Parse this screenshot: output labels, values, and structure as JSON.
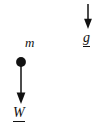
{
  "figure": {
    "type": "free-body-diagram",
    "background_color": "#ffffff",
    "ink_color": "#111111",
    "width": 104,
    "height": 138
  },
  "mass": {
    "label": "m",
    "shape": "filled-circle",
    "center_x": 21,
    "center_y": 62,
    "radius": 4.8,
    "fill_color": "#111111"
  },
  "vectors": [
    {
      "name": "weight",
      "label": "W",
      "notation": "underlined-vector",
      "direction": "down",
      "x": 21,
      "y_start": 66,
      "y_end": 104,
      "shaft_width": 1.4,
      "arrowhead": "solid-triangle",
      "color": "#111111"
    },
    {
      "name": "gravitational-field",
      "label": "g",
      "notation": "underlined-vector",
      "direction": "down",
      "x": 88,
      "y_start": 4,
      "y_end": 29,
      "shaft_width": 1.4,
      "arrowhead": "solid-triangle",
      "color": "#111111"
    }
  ],
  "labels": {
    "mass_label": "m",
    "weight_label": "W",
    "gravity_label": "g"
  }
}
